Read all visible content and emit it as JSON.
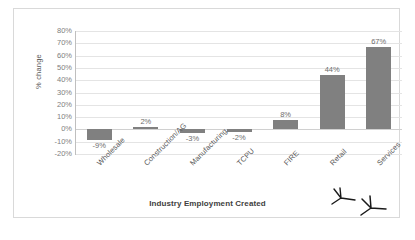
{
  "chart_data": {
    "type": "bar",
    "title": "",
    "xlabel": "Industry Employment Created",
    "ylabel": "% change",
    "categories": [
      "Wholesale",
      "Construction/AG",
      "Manufacturing",
      "TCPU",
      "FIRE",
      "Retail",
      "Services"
    ],
    "values": [
      -9,
      2,
      -3,
      -2,
      8,
      44,
      67
    ],
    "value_labels": [
      "-9%",
      "2%",
      "-3%",
      "-2%",
      "8%",
      "44%",
      "67%"
    ],
    "ylim": [
      -20,
      80
    ],
    "ytick_step": 10,
    "ytick_labels": [
      "80%",
      "70%",
      "60%",
      "50%",
      "40%",
      "30%",
      "20%",
      "10%",
      "0%",
      "-10%",
      "-20%"
    ],
    "ytick_values": [
      80,
      70,
      60,
      50,
      40,
      30,
      20,
      10,
      0,
      -10,
      -20
    ],
    "grid": true,
    "legend": "none",
    "series_color": "#808080",
    "gridline_color": "#e4e4e4",
    "annotations": [
      {
        "name": "arrow-retail",
        "target": "Retail",
        "kind": "handdrawn-arrowhead"
      },
      {
        "name": "arrow-services",
        "target": "Services",
        "kind": "handdrawn-arrowhead"
      }
    ]
  }
}
